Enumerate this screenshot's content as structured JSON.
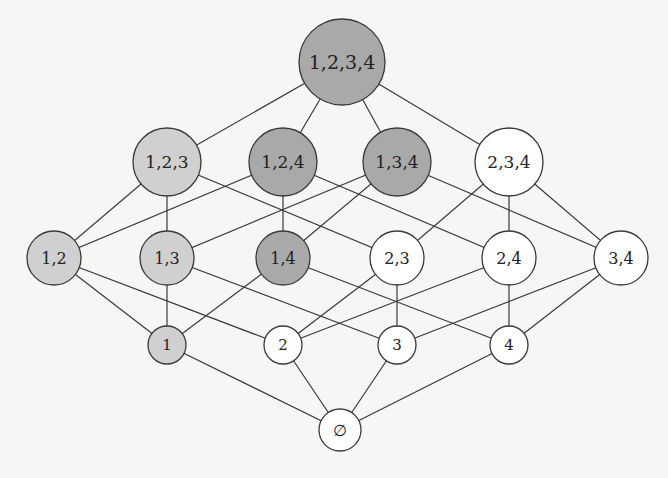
{
  "diagram": {
    "colors": {
      "dark": "#a9a9a9",
      "light": "#d0d0d0",
      "white": "#ffffff",
      "stroke": "#3a3a3a"
    },
    "nodes": [
      {
        "id": "1234",
        "label": "1,2,3,4",
        "x": 342,
        "y": 62,
        "r": 43,
        "fill": "dark",
        "font": 19
      },
      {
        "id": "123",
        "label": "1,2,3",
        "x": 167,
        "y": 162,
        "r": 34,
        "fill": "light",
        "font": 17
      },
      {
        "id": "124",
        "label": "1,2,4",
        "x": 283,
        "y": 162,
        "r": 34,
        "fill": "dark",
        "font": 17
      },
      {
        "id": "134",
        "label": "1,3,4",
        "x": 397,
        "y": 162,
        "r": 34,
        "fill": "dark",
        "font": 17
      },
      {
        "id": "234",
        "label": "2,3,4",
        "x": 509,
        "y": 162,
        "r": 34,
        "fill": "white",
        "font": 17
      },
      {
        "id": "12",
        "label": "1,2",
        "x": 54,
        "y": 258,
        "r": 27,
        "fill": "light",
        "font": 16
      },
      {
        "id": "13",
        "label": "1,3",
        "x": 167,
        "y": 258,
        "r": 27,
        "fill": "light",
        "font": 16
      },
      {
        "id": "14",
        "label": "1,4",
        "x": 283,
        "y": 258,
        "r": 27,
        "fill": "dark",
        "font": 16
      },
      {
        "id": "23",
        "label": "2,3",
        "x": 397,
        "y": 258,
        "r": 27,
        "fill": "white",
        "font": 16
      },
      {
        "id": "24",
        "label": "2,4",
        "x": 509,
        "y": 258,
        "r": 27,
        "fill": "white",
        "font": 16
      },
      {
        "id": "34",
        "label": "3,4",
        "x": 621,
        "y": 258,
        "r": 27,
        "fill": "white",
        "font": 16
      },
      {
        "id": "1",
        "label": "1",
        "x": 167,
        "y": 345,
        "r": 19,
        "fill": "light",
        "font": 15
      },
      {
        "id": "2",
        "label": "2",
        "x": 283,
        "y": 345,
        "r": 19,
        "fill": "white",
        "font": 15
      },
      {
        "id": "3",
        "label": "3",
        "x": 397,
        "y": 345,
        "r": 19,
        "fill": "white",
        "font": 15
      },
      {
        "id": "4",
        "label": "4",
        "x": 509,
        "y": 345,
        "r": 19,
        "fill": "white",
        "font": 15
      },
      {
        "id": "empty",
        "label": "∅",
        "x": 340,
        "y": 430,
        "r": 21,
        "fill": "white",
        "font": 16
      }
    ],
    "edges": [
      [
        "1234",
        "123"
      ],
      [
        "1234",
        "124"
      ],
      [
        "1234",
        "134"
      ],
      [
        "1234",
        "234"
      ],
      [
        "123",
        "12"
      ],
      [
        "123",
        "13"
      ],
      [
        "123",
        "23"
      ],
      [
        "124",
        "12"
      ],
      [
        "124",
        "14"
      ],
      [
        "124",
        "24"
      ],
      [
        "134",
        "13"
      ],
      [
        "134",
        "14"
      ],
      [
        "134",
        "34"
      ],
      [
        "234",
        "23"
      ],
      [
        "234",
        "24"
      ],
      [
        "234",
        "34"
      ],
      [
        "12",
        "1"
      ],
      [
        "12",
        "2"
      ],
      [
        "13",
        "1"
      ],
      [
        "13",
        "3"
      ],
      [
        "14",
        "1"
      ],
      [
        "14",
        "4"
      ],
      [
        "23",
        "2"
      ],
      [
        "23",
        "3"
      ],
      [
        "24",
        "2"
      ],
      [
        "24",
        "4"
      ],
      [
        "34",
        "3"
      ],
      [
        "34",
        "4"
      ],
      [
        "1",
        "empty"
      ],
      [
        "2",
        "empty"
      ],
      [
        "3",
        "empty"
      ],
      [
        "4",
        "empty"
      ]
    ]
  }
}
